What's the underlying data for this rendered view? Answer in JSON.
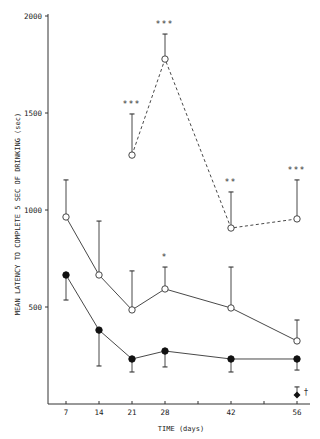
{
  "chart_data": {
    "type": "line",
    "title": "",
    "xlabel": "TIME (days)",
    "ylabel": "MEAN LATENCY TO COMPLETE 5 SEC OF DRINKING (sec)",
    "xlim": [
      4,
      59
    ],
    "ylim": [
      0,
      2000
    ],
    "x_ticks": [
      7,
      14,
      21,
      28,
      35,
      42,
      49,
      56
    ],
    "x_tick_labels": [
      "7",
      "14",
      "21",
      "28",
      "",
      "42",
      "",
      "56"
    ],
    "y_ticks": [
      500,
      1000,
      1500,
      2000
    ],
    "y_tick_labels": [
      "500",
      "1000",
      "1500",
      "2000"
    ],
    "grid": false,
    "legend": null,
    "series": [
      {
        "name": "open-circle-dashed",
        "marker": "open-circle",
        "line": "dashed",
        "x": [
          21,
          28,
          42,
          56
        ],
        "values": [
          1283,
          1778,
          907,
          954
        ],
        "error_upper": [
          1495,
          1907,
          1093,
          1155
        ],
        "annotations": [
          "***",
          "***",
          "**",
          "***"
        ]
      },
      {
        "name": "open-circle-solid",
        "marker": "open-circle",
        "line": "solid",
        "x": [
          7,
          14,
          21,
          28,
          42,
          56
        ],
        "values": [
          964,
          665,
          485,
          593,
          495,
          325
        ],
        "error_upper": [
          1155,
          943,
          686,
          706,
          706,
          433
        ],
        "annotations": [
          "",
          "",
          "",
          "*",
          "",
          ""
        ]
      },
      {
        "name": "filled-circle-solid",
        "marker": "filled-circle",
        "line": "solid",
        "x": [
          7,
          14,
          21,
          28,
          42,
          56
        ],
        "values": [
          665,
          381,
          232,
          273,
          232,
          232
        ],
        "error_lower": [
          536,
          196,
          165,
          191,
          165,
          175
        ],
        "annotations": [
          "",
          "",
          "",
          "",
          "",
          ""
        ]
      },
      {
        "name": "filled-diamond",
        "marker": "filled-diamond",
        "line": "none",
        "x": [
          56
        ],
        "values": [
          46
        ],
        "error_upper": [
          88
        ],
        "annotations": [
          "†"
        ]
      }
    ]
  }
}
